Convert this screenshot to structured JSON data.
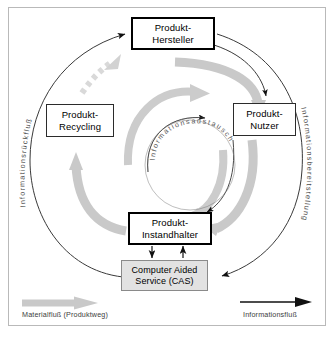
{
  "figure": {
    "colors": {
      "material_flow": "#c9c9c9",
      "information_flow": "#1a1a1a",
      "cas_fill": "#e2e2e2",
      "frame": "#b9b9b9",
      "arc_text": "#4a4a4a"
    }
  },
  "nodes": {
    "hersteller": {
      "line1": "Produkt-",
      "line2": "Hersteller"
    },
    "nutzer": {
      "line1": "Produkt-",
      "line2": "Nutzer"
    },
    "recycling": {
      "line1": "Produkt-",
      "line2": "Recycling"
    },
    "instandhalter": {
      "line1": "Produkt-",
      "line2": "Instandhalter"
    },
    "cas": {
      "line1": "Computer Aided",
      "line2": "Service (CAS)"
    }
  },
  "arc_labels": {
    "left": "Informationsrückfluß",
    "right": "Informationsbereitstellung",
    "inner": "Informationsaustausch"
  },
  "legend": {
    "material_flow": "Materialfluß (Produktweg)",
    "information_flow": "Informationsfluß"
  }
}
